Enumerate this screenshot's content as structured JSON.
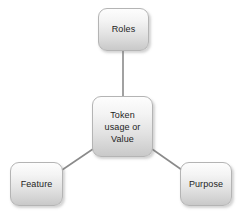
{
  "diagram": {
    "type": "hub-and-spoke",
    "background_color": "#ffffff",
    "node_fill_top_color": "#fdfdfd",
    "node_fill_bottom_color": "#c9c9c9",
    "node_border_color": "#b4b4b4",
    "edge_color": "#8a8a8a",
    "label_color": "#1d1d1d",
    "center": {
      "id": "token-usage-or-value",
      "label": "Token\nusage or\nValue"
    },
    "spokes": [
      {
        "id": "roles",
        "label": "Roles"
      },
      {
        "id": "feature",
        "label": "Feature"
      },
      {
        "id": "purpose",
        "label": "Purpose"
      }
    ],
    "edges": [
      {
        "from": "token-usage-or-value",
        "to": "roles"
      },
      {
        "from": "token-usage-or-value",
        "to": "feature"
      },
      {
        "from": "token-usage-or-value",
        "to": "purpose"
      }
    ]
  }
}
